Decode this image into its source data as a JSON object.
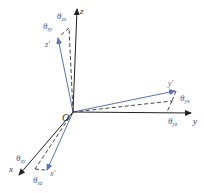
{
  "diagram": {
    "origin": {
      "label": "O",
      "x": 73,
      "y": 112
    },
    "axes": [
      {
        "name": "z",
        "label": "z",
        "tip": [
          77,
          8
        ]
      },
      {
        "name": "y",
        "label": "y",
        "tip": [
          192,
          113
        ]
      },
      {
        "name": "x",
        "label": "x",
        "tip": [
          18,
          176
        ]
      }
    ],
    "rotated_axes": [
      {
        "name": "z-prime",
        "label": "z'",
        "tip": [
          58,
          37
        ]
      },
      {
        "name": "y-prime",
        "label": "y'",
        "tip": [
          176,
          91
        ]
      },
      {
        "name": "x-prime",
        "label": "x'",
        "tip": [
          47,
          171
        ]
      }
    ],
    "angles": {
      "theta_zx": {
        "symbol": "θ",
        "sub": "zx"
      },
      "theta_zy": {
        "symbol": "θ",
        "sub": "zy"
      },
      "theta_yx": {
        "symbol": "θ",
        "sub": "yx"
      },
      "theta_yz": {
        "symbol": "θ",
        "sub": "yz"
      },
      "theta_xy": {
        "symbol": "θ",
        "sub": "xy"
      },
      "theta_xz": {
        "symbol": "θ",
        "sub": "xz"
      }
    },
    "colors": {
      "axis": "#222222",
      "rotated_axis": "#5a72b0",
      "dashed": "#333333"
    }
  }
}
